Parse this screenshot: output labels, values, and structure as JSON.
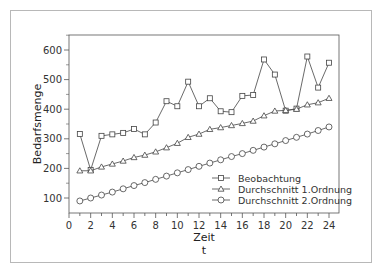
{
  "chart_data": {
    "type": "line",
    "title": "",
    "xlabel": "Zeit",
    "xlabel_sub": "t",
    "ylabel": "Bedarfsmenge",
    "xlim": [
      0,
      24
    ],
    "ylim": [
      50,
      650
    ],
    "xticks": [
      0,
      2,
      4,
      6,
      8,
      10,
      12,
      14,
      16,
      18,
      20,
      22,
      24
    ],
    "yticks": [
      100,
      200,
      300,
      400,
      500,
      600
    ],
    "grid": false,
    "legend_position": "lower right",
    "x": [
      1,
      2,
      3,
      4,
      5,
      6,
      7,
      8,
      9,
      10,
      11,
      12,
      13,
      14,
      15,
      16,
      17,
      18,
      19,
      20,
      21,
      22,
      23,
      24
    ],
    "series": [
      {
        "name": "Beobachtung",
        "marker": "square",
        "values": [
          316,
          195,
          310,
          315,
          320,
          333,
          315,
          355,
          427,
          410,
          493,
          410,
          437,
          393,
          390,
          445,
          448,
          568,
          517,
          395,
          402,
          578,
          473,
          557
        ]
      },
      {
        "name": "Durchschnitt 1.Ordnung",
        "marker": "triangle",
        "values": [
          192,
          192,
          205,
          215,
          225,
          237,
          245,
          256,
          270,
          285,
          305,
          316,
          332,
          338,
          345,
          352,
          360,
          378,
          394,
          396,
          400,
          415,
          422,
          437
        ]
      },
      {
        "name": "Durchschnitt 2.Ordnung",
        "marker": "circle",
        "values": [
          90,
          100,
          110,
          120,
          131,
          142,
          152,
          163,
          174,
          185,
          196,
          207,
          218,
          229,
          240,
          250,
          261,
          272,
          283,
          294,
          305,
          316,
          328,
          340
        ]
      }
    ]
  }
}
